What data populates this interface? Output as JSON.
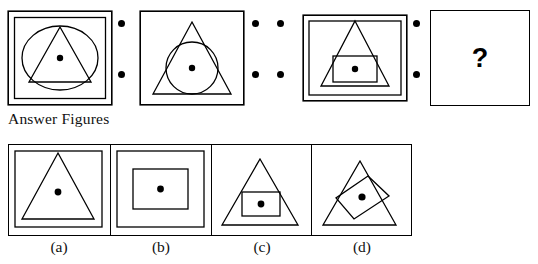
{
  "puzzle": {
    "type": "figure-series-analogy",
    "section_heading": "Answer Figures",
    "missing_marker": "?",
    "problem_panels": [
      {
        "index": 1,
        "name": "problem-figure-1",
        "shapes": [
          "outer-square",
          "inner-square",
          "ellipse",
          "triangle",
          "center-dot"
        ],
        "shape_count": 5
      },
      {
        "index": 2,
        "name": "problem-figure-2",
        "shapes": [
          "square",
          "triangle",
          "circle",
          "center-dot"
        ],
        "shape_count": 4
      },
      {
        "index": 3,
        "name": "problem-figure-3",
        "shapes": [
          "outer-square",
          "inner-square",
          "triangle",
          "rectangle",
          "center-dot"
        ],
        "shape_count": 5
      },
      {
        "index": 4,
        "name": "problem-figure-4-unknown",
        "shapes": [
          "question-mark"
        ],
        "shape_count": 0
      }
    ],
    "separators": [
      {
        "name": "separator-1",
        "dot_columns": 1,
        "dots_per_column": 2,
        "total_dots": 2
      },
      {
        "name": "separator-2",
        "dot_columns": 2,
        "dots_per_column": 2,
        "total_dots": 4
      },
      {
        "name": "separator-3",
        "dot_columns": 1,
        "dots_per_column": 2,
        "total_dots": 2
      }
    ],
    "answer_options": [
      {
        "key": "a",
        "label": "(a)",
        "shapes": [
          "outer-square",
          "inner-square",
          "triangle",
          "center-dot"
        ],
        "shape_count": 4
      },
      {
        "key": "b",
        "label": "(b)",
        "shapes": [
          "outer-square",
          "inner-square",
          "rectangle",
          "center-dot"
        ],
        "shape_count": 4
      },
      {
        "key": "c",
        "label": "(c)",
        "shapes": [
          "square",
          "triangle",
          "rectangle",
          "center-dot"
        ],
        "shape_count": 4
      },
      {
        "key": "d",
        "label": "(d)",
        "shapes": [
          "square",
          "triangle",
          "tilted-rectangle",
          "center-dot"
        ],
        "shape_count": 4
      }
    ],
    "colors": {
      "ink": "#000000",
      "background": "#ffffff",
      "text": "#111111"
    }
  }
}
